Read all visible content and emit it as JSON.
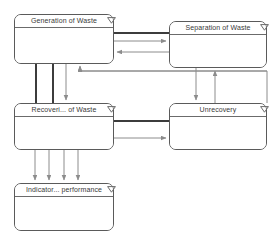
{
  "diagram": {
    "background_color": "#ffffff",
    "node_border_color": "#5a5a5a",
    "link_color": "#8c8c8c",
    "thick_link_color": "#3c3c3c",
    "nodes": [
      {
        "id": "generation",
        "label": "Generation of Waste",
        "collapse_icon": "chevron-down-triangle-icon",
        "x": 14,
        "y": 14,
        "w": 100,
        "h": 50
      },
      {
        "id": "separation",
        "label": "Separation of Waste",
        "collapse_icon": "chevron-down-triangle-icon",
        "x": 169,
        "y": 21,
        "w": 98,
        "h": 47
      },
      {
        "id": "recovery",
        "label": "Recoveri... of Waste",
        "collapse_icon": "chevron-down-triangle-icon",
        "x": 14,
        "y": 103,
        "w": 100,
        "h": 47
      },
      {
        "id": "unrecovery",
        "label": "Unrecovery",
        "collapse_icon": "chevron-down-triangle-icon",
        "x": 169,
        "y": 103,
        "w": 98,
        "h": 47
      },
      {
        "id": "indicator",
        "label": "Indicator... performance",
        "collapse_icon": "chevron-down-triangle-icon",
        "x": 14,
        "y": 183,
        "w": 100,
        "h": 48
      }
    ],
    "links": [
      {
        "id": "generation-to-separation-thick",
        "from": "generation",
        "to": "separation",
        "style": "thick",
        "arrow": false
      },
      {
        "id": "generation-to-separation-arrow",
        "from": "generation",
        "to": "separation",
        "style": "thin",
        "arrow": true
      },
      {
        "id": "separation-to-generation-arrow",
        "from": "separation",
        "to": "generation",
        "style": "thin",
        "arrow": true
      },
      {
        "id": "generation-to-recovery-thick-outer",
        "from": "generation",
        "to": "recovery",
        "style": "thick",
        "arrow": false
      },
      {
        "id": "generation-to-recovery-thick-inner",
        "from": "generation",
        "to": "recovery",
        "style": "thick",
        "arrow": false
      },
      {
        "id": "generation-to-recovery-arrow",
        "from": "generation",
        "to": "recovery",
        "style": "thin",
        "arrow": true
      },
      {
        "id": "unrecovery-to-generation-arrow",
        "from": "unrecovery",
        "to": "generation",
        "style": "thin",
        "arrow": true
      },
      {
        "id": "separation-to-unrecovery-arrow",
        "from": "separation",
        "to": "unrecovery",
        "style": "thin",
        "arrow": true
      },
      {
        "id": "unrecovery-to-separation-arrow",
        "from": "unrecovery",
        "to": "separation",
        "style": "thin",
        "arrow": true
      },
      {
        "id": "recovery-to-unrecovery-thick",
        "from": "recovery",
        "to": "unrecovery",
        "style": "thick",
        "arrow": false
      },
      {
        "id": "recovery-to-unrecovery-arrow",
        "from": "recovery",
        "to": "unrecovery",
        "style": "thin",
        "arrow": true
      },
      {
        "id": "recovery-to-indicator-arrow-1",
        "from": "recovery",
        "to": "indicator",
        "style": "thin",
        "arrow": true
      },
      {
        "id": "recovery-to-indicator-arrow-2",
        "from": "recovery",
        "to": "indicator",
        "style": "thin",
        "arrow": true
      },
      {
        "id": "recovery-to-indicator-arrow-3",
        "from": "recovery",
        "to": "indicator",
        "style": "thin",
        "arrow": true
      },
      {
        "id": "recovery-to-indicator-arrow-4",
        "from": "recovery",
        "to": "indicator",
        "style": "thin",
        "arrow": true
      }
    ]
  }
}
